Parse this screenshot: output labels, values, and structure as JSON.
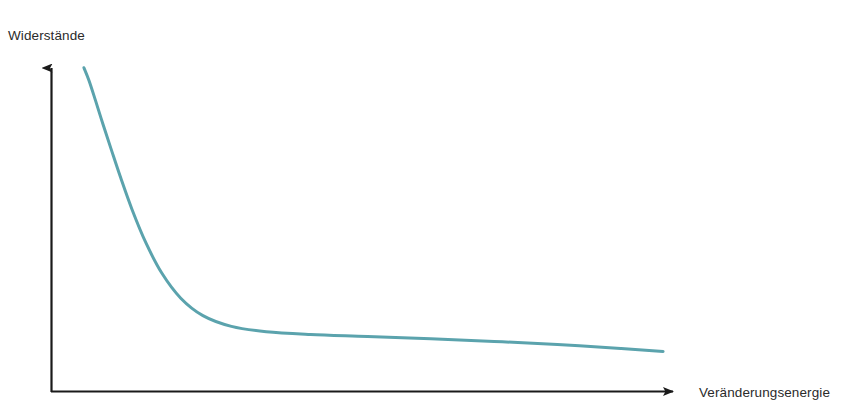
{
  "figure": {
    "background_color": "#ffffff",
    "width": 857,
    "height": 419,
    "y_axis_label": "Widerstände",
    "x_axis_label": "Veränderungsenergie",
    "axis_color": "#1a1a1a",
    "curve_color": "#5ba3ad",
    "label_color": "#2b2b2b"
  },
  "chart_data": {
    "type": "line",
    "title": "",
    "subtitle": "",
    "xlabel": "Veränderungsenergie",
    "ylabel": "Widerstände",
    "grid": false,
    "legend": null,
    "legend_position": "none",
    "axis_style": "arrow-headed open axes, no tick marks, no tick labels",
    "xlim": [
      0,
      1
    ],
    "ylim": [
      0,
      1
    ],
    "xticks": [],
    "yticks": [],
    "annotations": [],
    "series": [
      {
        "name": "Widerstände",
        "color": "#5ba3ad",
        "line_width": 3,
        "description": "Monoton fallende, hyperbelartige Kurve: steiler Abfall bei geringer Veränderungsenergie, danach flaches, leicht abfallendes Plateau.",
        "x": [
          0.052,
          0.06,
          0.07,
          0.082,
          0.095,
          0.11,
          0.128,
          0.15,
          0.175,
          0.205,
          0.24,
          0.285,
          0.34,
          0.41,
          0.5,
          0.6,
          0.7,
          0.8,
          0.9,
          0.967
        ],
        "y": [
          0.968,
          0.93,
          0.872,
          0.8,
          0.725,
          0.64,
          0.545,
          0.445,
          0.355,
          0.28,
          0.228,
          0.196,
          0.18,
          0.172,
          0.166,
          0.159,
          0.151,
          0.142,
          0.13,
          0.121
        ]
      }
    ]
  }
}
